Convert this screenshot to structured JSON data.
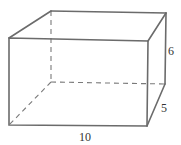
{
  "figure": {
    "type": "rectangular-prism",
    "labels": {
      "length": "10",
      "height": "6",
      "depth": "5"
    },
    "colors": {
      "edge": "#6b6b6b",
      "hidden_edge": "#7a7a7a",
      "text": "#333333"
    }
  }
}
